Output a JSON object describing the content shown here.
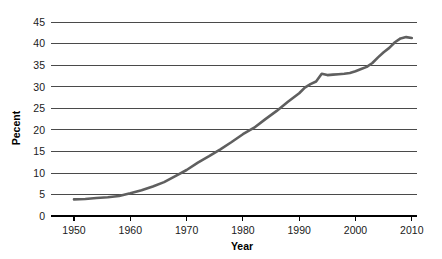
{
  "chart_data": {
    "type": "line",
    "title": "",
    "xlabel": "Year",
    "ylabel": "Pecent",
    "xlim": [
      1946,
      2011
    ],
    "ylim": [
      0,
      46.5
    ],
    "xticks": [
      1950,
      1960,
      1970,
      1980,
      1990,
      2000,
      2010
    ],
    "yticks": [
      0,
      5,
      10,
      15,
      20,
      25,
      30,
      35,
      40,
      45
    ],
    "xtick_labels": [
      "1950",
      "1960",
      "1970",
      "1980",
      "1990",
      "2000",
      "2010"
    ],
    "ytick_labels": [
      "0",
      "5",
      "10",
      "15",
      "20",
      "25",
      "30",
      "35",
      "40",
      "45"
    ],
    "grid": "horizontal",
    "legend": "none",
    "line_color": "#5f5f5f",
    "series": [
      {
        "name": "Percent",
        "x": [
          1950,
          1952,
          1954,
          1956,
          1958,
          1960,
          1962,
          1964,
          1966,
          1968,
          1970,
          1972,
          1974,
          1976,
          1978,
          1980,
          1982,
          1984,
          1986,
          1988,
          1990,
          1991,
          1992,
          1993,
          1994,
          1995,
          1996,
          1997,
          1998,
          1999,
          2000,
          2001,
          2002,
          2003,
          2004,
          2005,
          2006,
          2007,
          2008,
          2009,
          2010
        ],
        "values": [
          3.9,
          4.0,
          4.2,
          4.4,
          4.7,
          5.3,
          6.0,
          6.9,
          7.9,
          9.3,
          10.7,
          12.4,
          13.9,
          15.5,
          17.2,
          19.0,
          20.5,
          22.5,
          24.4,
          26.5,
          28.5,
          29.8,
          30.6,
          31.2,
          33.0,
          32.7,
          32.8,
          32.9,
          33.0,
          33.2,
          33.6,
          34.1,
          34.6,
          35.5,
          36.8,
          38.0,
          39.0,
          40.3,
          41.2,
          41.5,
          41.3
        ]
      }
    ]
  },
  "axes": {
    "x_title": "Year",
    "y_title": "Pecent"
  }
}
